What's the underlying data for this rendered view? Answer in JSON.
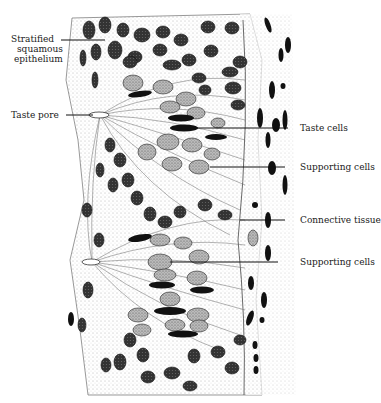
{
  "figure": {
    "labels_left": [
      {
        "id": "stratified",
        "lines": [
          "Stratified",
          "squamous",
          "epithelium"
        ],
        "x": 8,
        "y": 34
      },
      {
        "id": "taste-pore",
        "lines": [
          "Taste pore"
        ],
        "x": 8,
        "y": 110
      }
    ],
    "labels_right": [
      {
        "id": "taste-cells",
        "text": "Taste cells",
        "x": 300,
        "y": 124
      },
      {
        "id": "supporting-cells-1",
        "text": "Supporting cells",
        "x": 300,
        "y": 162
      },
      {
        "id": "connective-tissue",
        "text": "Connective tissue",
        "x": 300,
        "y": 216
      },
      {
        "id": "supporting-cells-2",
        "text": "Supporting cells",
        "x": 300,
        "y": 258
      }
    ],
    "colors": {
      "ink": "#111111",
      "nucleus_dark": "#2a2a2a",
      "nucleus_light": "#8a8a8a",
      "background": "#ffffff"
    }
  }
}
